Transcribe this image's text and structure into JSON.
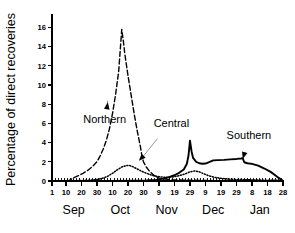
{
  "chart_data": {
    "type": "line",
    "title": "",
    "subtitle": "",
    "xlabel": "",
    "ylabel": "Percentage of direct recoveries",
    "ylim": [
      0,
      17.4
    ],
    "yticks": [
      0,
      2,
      4,
      6,
      8,
      10,
      12,
      14,
      16
    ],
    "ytick_labels": [
      "0",
      "2",
      "4",
      "6",
      "8",
      "10",
      "12",
      "14",
      "16"
    ],
    "xlim": [
      1,
      150
    ],
    "grid": false,
    "legend": "inline-annotations",
    "x_unit": "day index from Sep 1",
    "xtick_labels": [
      "1",
      "10",
      "20",
      "30",
      "10",
      "20",
      "30",
      "9",
      "19",
      "29",
      "9",
      "19",
      "29",
      "8",
      "18",
      "28"
    ],
    "xtick_days": [
      1,
      10,
      20,
      30,
      40,
      50,
      60,
      70,
      80,
      90,
      100,
      110,
      120,
      130,
      140,
      150
    ],
    "month_labels": [
      "Sep",
      "Oct",
      "Nov",
      "Dec",
      "Jan"
    ],
    "month_centers": [
      15,
      45,
      75,
      105,
      135
    ],
    "annotations": [
      {
        "label": "Northern",
        "x_text": 35,
        "y_text": 6.0,
        "x_point": 37,
        "y_point": 8.2
      },
      {
        "label": "Central",
        "x_text": 78,
        "y_text": 5.6,
        "x_point": 57,
        "y_point": 2.1
      },
      {
        "label": "Southern",
        "x_text": 128,
        "y_text": 4.4,
        "x_point": 124,
        "y_point": 2.3
      }
    ],
    "series": [
      {
        "name": "Northern",
        "style": "dashed",
        "points": [
          [
            1,
            0.0
          ],
          [
            8,
            0.0
          ],
          [
            12,
            0.05
          ],
          [
            15,
            0.35
          ],
          [
            18,
            0.55
          ],
          [
            21,
            0.8
          ],
          [
            24,
            1.1
          ],
          [
            27,
            1.5
          ],
          [
            30,
            2.0
          ],
          [
            32,
            2.6
          ],
          [
            34,
            3.3
          ],
          [
            36,
            4.2
          ],
          [
            38,
            5.4
          ],
          [
            40,
            7.0
          ],
          [
            42,
            9.0
          ],
          [
            44,
            11.4
          ],
          [
            45,
            13.6
          ],
          [
            46,
            15.8
          ],
          [
            47,
            14.6
          ],
          [
            48,
            13.2
          ],
          [
            50,
            11.0
          ],
          [
            52,
            9.0
          ],
          [
            54,
            7.0
          ],
          [
            56,
            5.2
          ],
          [
            58,
            3.6
          ],
          [
            59,
            2.6
          ],
          [
            60,
            2.0
          ],
          [
            62,
            1.4
          ],
          [
            64,
            1.0
          ],
          [
            66,
            0.7
          ],
          [
            68,
            0.45
          ],
          [
            70,
            0.3
          ],
          [
            74,
            0.2
          ],
          [
            80,
            0.12
          ],
          [
            90,
            0.08
          ],
          [
            100,
            0.05
          ],
          [
            120,
            0.03
          ],
          [
            150,
            0.02
          ]
        ]
      },
      {
        "name": "Central",
        "style": "dotted",
        "points": [
          [
            1,
            0.0
          ],
          [
            10,
            0.0
          ],
          [
            20,
            0.05
          ],
          [
            26,
            0.1
          ],
          [
            30,
            0.15
          ],
          [
            34,
            0.3
          ],
          [
            37,
            0.5
          ],
          [
            40,
            0.8
          ],
          [
            43,
            1.15
          ],
          [
            46,
            1.45
          ],
          [
            49,
            1.6
          ],
          [
            51,
            1.62
          ],
          [
            53,
            1.5
          ],
          [
            56,
            1.25
          ],
          [
            59,
            1.0
          ],
          [
            62,
            0.8
          ],
          [
            65,
            0.62
          ],
          [
            68,
            0.5
          ],
          [
            71,
            0.42
          ],
          [
            75,
            0.38
          ],
          [
            79,
            0.42
          ],
          [
            83,
            0.55
          ],
          [
            87,
            0.75
          ],
          [
            90,
            0.95
          ],
          [
            93,
            1.05
          ],
          [
            96,
            0.95
          ],
          [
            99,
            0.75
          ],
          [
            102,
            0.55
          ],
          [
            106,
            0.38
          ],
          [
            110,
            0.28
          ],
          [
            115,
            0.2
          ],
          [
            122,
            0.15
          ],
          [
            132,
            0.1
          ],
          [
            142,
            0.08
          ],
          [
            150,
            0.05
          ]
        ]
      },
      {
        "name": "Southern",
        "style": "solid",
        "points": [
          [
            1,
            0.0
          ],
          [
            20,
            0.0
          ],
          [
            40,
            0.0
          ],
          [
            55,
            0.02
          ],
          [
            62,
            0.05
          ],
          [
            68,
            0.12
          ],
          [
            72,
            0.22
          ],
          [
            76,
            0.38
          ],
          [
            80,
            0.6
          ],
          [
            83,
            0.85
          ],
          [
            86,
            1.2
          ],
          [
            88,
            1.8
          ],
          [
            89,
            2.6
          ],
          [
            90,
            4.2
          ],
          [
            91,
            3.1
          ],
          [
            92,
            2.4
          ],
          [
            94,
            2.0
          ],
          [
            96,
            1.85
          ],
          [
            98,
            1.8
          ],
          [
            100,
            1.82
          ],
          [
            102,
            1.95
          ],
          [
            105,
            2.15
          ],
          [
            108,
            2.18
          ],
          [
            112,
            2.2
          ],
          [
            116,
            2.25
          ],
          [
            120,
            2.3
          ],
          [
            123,
            2.35
          ],
          [
            124,
            2.38
          ],
          [
            125,
            1.95
          ],
          [
            127,
            1.85
          ],
          [
            130,
            1.78
          ],
          [
            134,
            1.6
          ],
          [
            138,
            1.3
          ],
          [
            142,
            0.95
          ],
          [
            145,
            0.6
          ],
          [
            147,
            0.35
          ],
          [
            149,
            0.12
          ],
          [
            150,
            0.0
          ]
        ]
      }
    ]
  }
}
